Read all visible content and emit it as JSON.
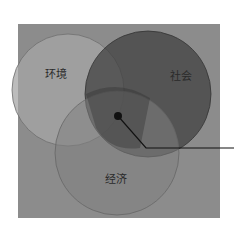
{
  "diagram": {
    "type": "venn",
    "background_color": "#8a8a8a",
    "circles": [
      {
        "id": "environment",
        "label": "环境",
        "color": "#9a9a9a"
      },
      {
        "id": "society",
        "label": "社会",
        "color": "#454545"
      },
      {
        "id": "economy",
        "label": "经济",
        "color": "#7a7a7a"
      }
    ],
    "center_marker": {
      "color": "#111111"
    },
    "callout_line": {
      "color": "#111111"
    }
  }
}
